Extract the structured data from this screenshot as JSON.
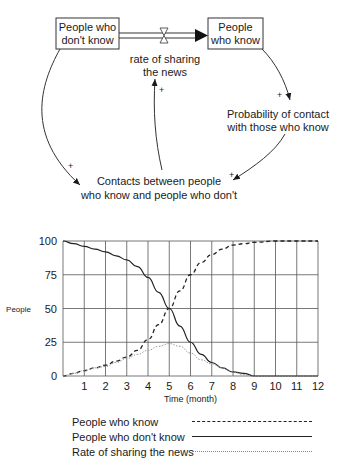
{
  "diagram": {
    "stocks": [
      {
        "id": "dont_know",
        "line1": "People who",
        "line2": "don't know"
      },
      {
        "id": "know",
        "line1": "People",
        "line2": "who know"
      }
    ],
    "flow": {
      "line1": "rate of sharing",
      "line2": "the news"
    },
    "auxiliaries": [
      {
        "id": "probability",
        "line1": "Probability of contact",
        "line2": "with those who know"
      },
      {
        "id": "contacts",
        "line1": "Contacts between people",
        "line2": "who know and people who don't"
      }
    ],
    "link_polarity": "+"
  },
  "chart_data": {
    "type": "line",
    "title": "",
    "xlabel": "Time (month)",
    "ylabel": "People",
    "x_ticks": [
      "1",
      "2",
      "3",
      "4",
      "5",
      "6",
      "7",
      "8",
      "9",
      "10",
      "11",
      "12"
    ],
    "y_ticks": [
      "0",
      "25",
      "50",
      "75",
      "100"
    ],
    "xlim": [
      0,
      12
    ],
    "ylim": [
      0,
      100
    ],
    "grid": true,
    "legend_position": "bottom",
    "x": [
      0,
      0.5,
      1,
      1.5,
      2,
      2.5,
      3,
      3.5,
      4,
      4.5,
      5,
      5.5,
      6,
      6.5,
      7,
      7.5,
      8,
      8.5,
      9,
      10,
      11,
      12
    ],
    "series": [
      {
        "name": "People who know",
        "style": "dashed",
        "values": [
          0,
          2,
          4,
          6,
          8,
          11,
          14,
          19,
          27,
          38,
          50,
          63,
          75,
          84,
          90,
          94,
          97,
          98,
          99,
          100,
          100,
          100
        ]
      },
      {
        "name": "People who don't know",
        "style": "solid",
        "values": [
          100,
          98,
          96,
          94,
          92,
          89,
          86,
          81,
          73,
          62,
          50,
          37,
          25,
          16,
          10,
          6,
          3,
          2,
          0,
          0,
          0,
          0
        ]
      },
      {
        "name": "Rate of sharing the news",
        "style": "dotted",
        "values": [
          0,
          2,
          4,
          6,
          7,
          10,
          13,
          16,
          19,
          22,
          24,
          22,
          17,
          12,
          9,
          6,
          3,
          1,
          0,
          0,
          0,
          0
        ]
      }
    ]
  },
  "legend": [
    {
      "label": "People who know"
    },
    {
      "label": "People who don't know"
    },
    {
      "label": "Rate of sharing the news"
    }
  ]
}
